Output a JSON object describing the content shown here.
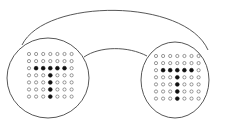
{
  "diagram": {
    "colors": {
      "stroke": "#444444",
      "filled": "#111111",
      "empty": "#ffffff",
      "background": "#ffffff"
    },
    "grid": {
      "rows": 7,
      "cols": 7
    },
    "pattern": [
      [
        0,
        0,
        0,
        0,
        0,
        0,
        0
      ],
      [
        0,
        0,
        0,
        0,
        0,
        0,
        0
      ],
      [
        0,
        1,
        1,
        1,
        1,
        1,
        0
      ],
      [
        0,
        0,
        0,
        1,
        0,
        0,
        0
      ],
      [
        0,
        0,
        0,
        1,
        0,
        0,
        0
      ],
      [
        0,
        0,
        0,
        1,
        0,
        0,
        0
      ],
      [
        0,
        0,
        0,
        1,
        0,
        0,
        0
      ]
    ],
    "panels": [
      {
        "name": "left-display",
        "cx": 48,
        "cy": 78,
        "rx": 41,
        "ry": 40,
        "grid_x": 29,
        "grid_y": 54,
        "spacing": 7.1
      },
      {
        "name": "right-display",
        "cx": 175,
        "cy": 80,
        "rx": 34,
        "ry": 38,
        "grid_x": 156,
        "grid_y": 56,
        "spacing": 7.1
      }
    ],
    "connector": {
      "outer": "M22 45 C 45 -2, 185 -2, 208 50",
      "inner": "M84 57 C 100 46, 128 46, 147 56"
    }
  }
}
